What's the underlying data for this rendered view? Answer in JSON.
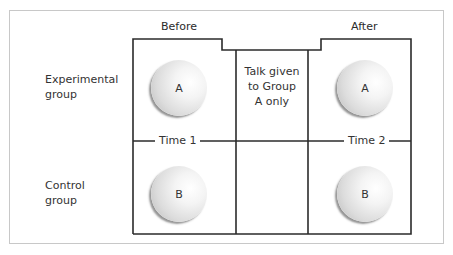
{
  "diagram": {
    "columns": {
      "before": "Before",
      "after": "After"
    },
    "rows": {
      "experimental": [
        "Experimental",
        "group"
      ],
      "control": [
        "Control",
        "group"
      ]
    },
    "intervention": [
      "Talk given",
      "to Group",
      "A only"
    ],
    "time_markers": {
      "time1": "Time 1",
      "time2": "Time 2"
    },
    "groups": {
      "experimental_before": "A",
      "experimental_after": "A",
      "control_before": "B",
      "control_after": "B"
    },
    "colors": {
      "line": "#2b2b2b",
      "frame": "#c8c8c8",
      "circle_light": "#ffffff",
      "circle_dark": "#b8b8b8"
    }
  }
}
